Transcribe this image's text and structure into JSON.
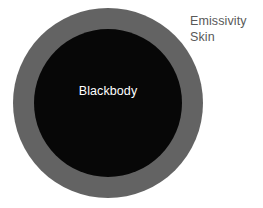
{
  "figure": {
    "type": "concentric-circle-diagram",
    "background_color": "#ffffff",
    "title_text": ""
  },
  "core": {
    "label": "Blackbody",
    "shape": "circle",
    "fill_color": "#070707",
    "text_color": "#ffffff",
    "radius_px": 74,
    "center_x_px": 108,
    "center_y_px": 103
  },
  "shell": {
    "shape": "annulus",
    "fill_color": "#636363",
    "outer_radius_px": 95,
    "inner_radius_px": 74,
    "center_x_px": 108,
    "center_y_px": 103,
    "thickness_px": 21
  },
  "annotation": {
    "line1": "Emissivity",
    "line2": "Skin",
    "text_color": "#595959",
    "position": "top-right"
  }
}
